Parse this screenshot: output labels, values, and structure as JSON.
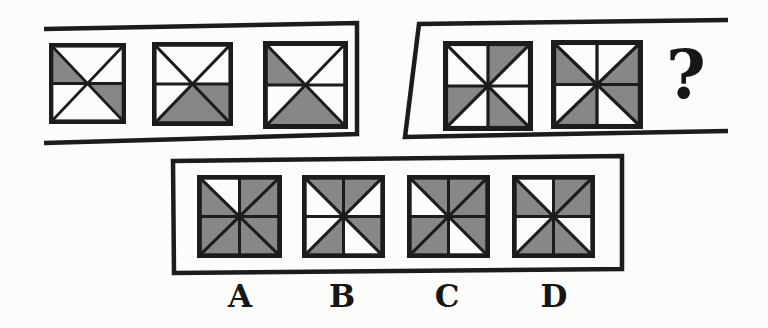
{
  "colors": {
    "shade": "#878787",
    "line": "#1c1c1c",
    "background": "#fcfcfb"
  },
  "question_mark": "?",
  "sequence_row_1": {
    "divisions": 6,
    "squares": [
      {
        "name": "sequence-square-1",
        "shaded": [
          "upper-left",
          "lower-right"
        ]
      },
      {
        "name": "sequence-square-2",
        "shaded": [
          "bottom",
          "lower-right"
        ]
      },
      {
        "name": "sequence-square-3",
        "shaded": [
          "upper-left",
          "bottom"
        ]
      }
    ]
  },
  "sequence_row_2": {
    "divisions": 8,
    "squares": [
      {
        "name": "sequence-square-4",
        "shaded": [
          "n-right",
          "w-lower",
          "s-right"
        ]
      },
      {
        "name": "sequence-square-5",
        "shaded": [
          "w-upper",
          "e-upper",
          "e-lower",
          "s-left"
        ]
      }
    ]
  },
  "options": {
    "divisions": 8,
    "items": [
      {
        "label": "A",
        "shaded": [
          "n-right",
          "e-upper",
          "e-lower",
          "s-right",
          "s-left",
          "w-lower",
          "w-upper"
        ]
      },
      {
        "label": "B",
        "shaded": [
          "n-left",
          "n-right",
          "e-lower",
          "s-left"
        ]
      },
      {
        "label": "C",
        "shaded": [
          "n-left",
          "n-right",
          "e-upper",
          "e-lower",
          "w-lower",
          "s-left"
        ]
      },
      {
        "label": "D",
        "shaded": [
          "n-right",
          "e-upper",
          "w-upper",
          "s-left",
          "s-right"
        ]
      }
    ]
  }
}
